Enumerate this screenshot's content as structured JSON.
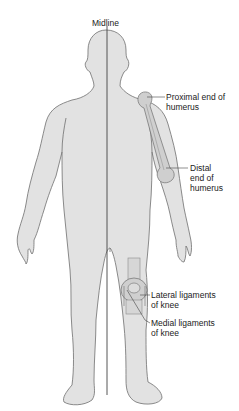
{
  "figure": {
    "type": "anatomical-diagram",
    "colors": {
      "body_fill": "#e2e2e2",
      "outline": "#6e6e6e",
      "bone_fill": "#cfcfcf",
      "midline": "#444444",
      "leader": "#444444",
      "text": "#222222"
    },
    "labels": {
      "midline": "Midline",
      "proximal_humerus": "Proximal end of\nhumerus",
      "distal_humerus": "Distal\nend of\nhumerus",
      "lateral_ligaments": "Lateral ligaments\nof knee",
      "medial_ligaments": "Medial ligaments\nof knee"
    }
  }
}
